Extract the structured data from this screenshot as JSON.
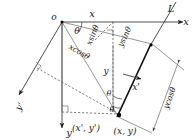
{
  "figure": {
    "type": "geometry-diagram",
    "background_color": "#ffffff",
    "line_color": "#333333",
    "emphasis_color": "#000000"
  },
  "labels": {
    "origin": "o",
    "axis_x": "x",
    "axis_y": "y",
    "axis_x_prime": "x'",
    "axis_y_prime": "y'",
    "line_L": "L",
    "angle_theta_origin": "θ",
    "angle_theta_mid": "θ",
    "angle_theta_point": "θ",
    "seg_x_top": "x",
    "seg_y_mid": "y",
    "seg_xcos": "xcosθ",
    "seg_xsin": "xsinθ",
    "seg_ysin": "ysinθ",
    "seg_ycos": "ycosθ",
    "point_rotated": "(x', y')",
    "point_original": "(x, y)"
  },
  "geometry": {
    "origin_point": [
      62,
      22
    ],
    "data_point": [
      122,
      114
    ],
    "x_axis_end": [
      186,
      22
    ],
    "y_axis_end": [
      83,
      132
    ],
    "line_L_top": [
      172,
      4
    ],
    "line_L_bottom": [
      118,
      118
    ],
    "x_prime_arrow": [
      140,
      79
    ],
    "y_prime_arrow": [
      16,
      98
    ]
  },
  "annotations": {
    "right_angle_marks": 3,
    "arrow_heads": 6,
    "dashed_segments": 4
  }
}
